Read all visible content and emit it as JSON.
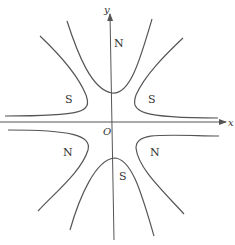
{
  "diagram": {
    "axes": {
      "x_label": "x",
      "y_label": "y",
      "origin_label": "O"
    },
    "regions": {
      "top": "N",
      "bottom": "S",
      "upper_left": "S",
      "upper_right": "S",
      "lower_left": "N",
      "lower_right": "N"
    },
    "colors": {
      "line": "#555555",
      "text": "#333333",
      "background": "#ffffff"
    }
  }
}
